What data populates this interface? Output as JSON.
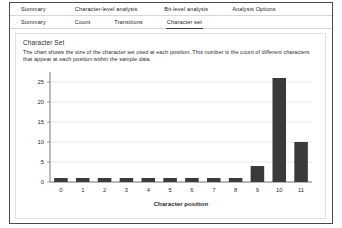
{
  "tabs_primary": [
    {
      "id": "summary",
      "label": "Summary",
      "active": false
    },
    {
      "id": "charlevel",
      "label": "Character-level analysis",
      "active": false
    },
    {
      "id": "bitlevel",
      "label": "Bit-level analysis",
      "active": false
    },
    {
      "id": "options",
      "label": "Analysis Options",
      "active": false
    }
  ],
  "tabs_secondary": [
    {
      "id": "summary",
      "label": "Summary",
      "active": false
    },
    {
      "id": "count",
      "label": "Count",
      "active": false
    },
    {
      "id": "transitions",
      "label": "Transitions",
      "active": false
    },
    {
      "id": "charset",
      "label": "Character set",
      "active": true
    }
  ],
  "panel": {
    "title": "Character Set",
    "description": "The chart shows the size of the character set used at each position. This number is the count of different characters that appear at each position within the sample data."
  },
  "colors": {
    "bar": "#3a3a3a",
    "grid": "#dcdcdc",
    "axis": "#6e6e6e",
    "text": "#2b2b2b",
    "frame": "#4a4a4a",
    "card_border": "#e2e2e2"
  },
  "chart_data": {
    "type": "bar",
    "title": "",
    "xlabel": "Character position",
    "ylabel": "",
    "categories": [
      "0",
      "1",
      "2",
      "3",
      "4",
      "5",
      "6",
      "7",
      "8",
      "9",
      "10",
      "11"
    ],
    "values": [
      1,
      1,
      1,
      1,
      1,
      1,
      1,
      1,
      1,
      4,
      26,
      10
    ],
    "ylim": [
      0,
      27
    ],
    "yticks": [
      0,
      5,
      10,
      15,
      20,
      25
    ],
    "grid": true,
    "legend": false
  }
}
